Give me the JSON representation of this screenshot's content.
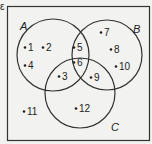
{
  "diagram": {
    "type": "venn",
    "universal_label": "ε",
    "colors": {
      "background": "#f2f2f0",
      "stroke": "#333333",
      "text": "#222222"
    },
    "sets": [
      {
        "id": "A",
        "label": "A",
        "cx": 53,
        "cy": 55,
        "r": 36,
        "label_x": 20,
        "label_y": 30
      },
      {
        "id": "B",
        "label": "B",
        "cx": 107,
        "cy": 55,
        "r": 35,
        "label_x": 133,
        "label_y": 33
      },
      {
        "id": "C",
        "label": "C",
        "cx": 80,
        "cy": 93,
        "r": 35,
        "label_x": 111,
        "label_y": 131
      }
    ],
    "elements": [
      {
        "value": "1",
        "x": 25,
        "y": 51,
        "region": "A only"
      },
      {
        "value": "2",
        "x": 43,
        "y": 51,
        "region": "A only"
      },
      {
        "value": "4",
        "x": 25,
        "y": 69,
        "region": "A only"
      },
      {
        "value": "5",
        "x": 74,
        "y": 51,
        "region": "A∩B only"
      },
      {
        "value": "6",
        "x": 74,
        "y": 66,
        "region": "A∩B∩C"
      },
      {
        "value": "3",
        "x": 59,
        "y": 80,
        "region": "A∩C only"
      },
      {
        "value": "9",
        "x": 91,
        "y": 81,
        "region": "B∩C only"
      },
      {
        "value": "7",
        "x": 101,
        "y": 36,
        "region": "B only"
      },
      {
        "value": "8",
        "x": 111,
        "y": 53,
        "region": "B only"
      },
      {
        "value": "10",
        "x": 116,
        "y": 70,
        "region": "B only"
      },
      {
        "value": "12",
        "x": 76,
        "y": 112,
        "region": "C only"
      },
      {
        "value": "11",
        "x": 24,
        "y": 115,
        "region": "outside"
      }
    ]
  }
}
